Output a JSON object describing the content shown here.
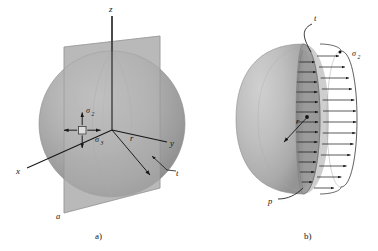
{
  "figure": {
    "background_color": "#ffffff",
    "ink_color": "#161616",
    "panels": [
      {
        "id": "panel-a",
        "caption": "a)",
        "description": "Sphere with vertical sectioning plane and 3D coordinate axes",
        "axes": [
          {
            "name": "z",
            "label": "z",
            "direction": "up"
          },
          {
            "name": "y",
            "label": "y",
            "direction": "right"
          },
          {
            "name": "x",
            "label": "x",
            "direction": "lower-left"
          }
        ],
        "labels": [
          {
            "name": "stress-sigma-2",
            "base": "σ",
            "sub": "2"
          },
          {
            "name": "stress-sigma-3",
            "base": "σ",
            "sub": "3"
          },
          {
            "name": "radius",
            "text": "r"
          },
          {
            "name": "thickness",
            "text": "t"
          },
          {
            "name": "plane-corner",
            "text": "a"
          }
        ],
        "colors": {
          "sphere_light": "#b9b9b9",
          "sphere_mid": "#a0a0a0",
          "sphere_dark": "#848484",
          "plane": "#b5b5b5"
        }
      },
      {
        "id": "panel-b",
        "caption": "b)",
        "description": "Cut hemisphere showing wall thickness and uniform membrane stress distribution",
        "labels": [
          {
            "name": "thickness",
            "text": "t"
          },
          {
            "name": "radius",
            "text": "r"
          },
          {
            "name": "internal-pressure",
            "text": "p"
          },
          {
            "name": "stress-sigma-2",
            "base": "σ",
            "sub": "2"
          }
        ],
        "stress_arrow_count": 17,
        "colors": {
          "shell_light": "#c2c2c2",
          "shell_mid": "#ababab",
          "rim_dark": "#8c8c8c",
          "cut_face": "#9a9a9a"
        }
      }
    ]
  }
}
